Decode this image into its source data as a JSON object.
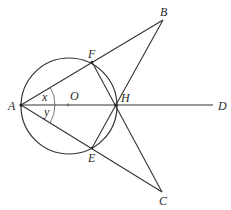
{
  "diagram": {
    "type": "geometry",
    "circle": {
      "center": "O",
      "cx": 69,
      "cy": 106,
      "r": 48
    },
    "points": {
      "A": {
        "label": "A",
        "x": 21,
        "y": 105,
        "lx": 8,
        "ly": 110
      },
      "B": {
        "label": "B",
        "x": 163,
        "y": 20,
        "lx": 161,
        "ly": 16
      },
      "C": {
        "label": "C",
        "x": 162,
        "y": 192,
        "lx": 159,
        "ly": 205
      },
      "D": {
        "label": "D",
        "x": 213,
        "y": 105,
        "lx": 218,
        "ly": 110
      },
      "E": {
        "label": "E",
        "x": 92,
        "y": 148,
        "lx": 88,
        "ly": 162
      },
      "F": {
        "label": "F",
        "x": 92,
        "y": 62,
        "lx": 88,
        "ly": 58
      },
      "H": {
        "label": "H",
        "x": 116,
        "y": 105,
        "lx": 121,
        "ly": 102
      },
      "O": {
        "label": "O",
        "x": 68,
        "y": 105,
        "lx": 70,
        "ly": 100
      }
    },
    "segments": [
      [
        "A",
        "B"
      ],
      [
        "A",
        "C"
      ],
      [
        "A",
        "D"
      ],
      [
        "B",
        "H"
      ],
      [
        "C",
        "H"
      ],
      [
        "F",
        "H"
      ],
      [
        "E",
        "H"
      ],
      [
        "B",
        "E"
      ],
      [
        "C",
        "F"
      ]
    ],
    "angles": {
      "x": {
        "label": "x",
        "lx": 42,
        "ly": 101
      },
      "y": {
        "label": "y",
        "lx": 44,
        "ly": 116
      }
    }
  }
}
